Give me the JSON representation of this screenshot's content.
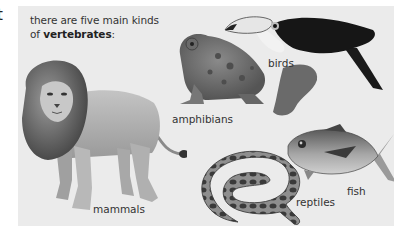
{
  "edge_fragment": "t",
  "intro": {
    "line1": "there are five main kinds",
    "line2_prefix": "of ",
    "line2_bold": "vertebrates",
    "line2_suffix": ":"
  },
  "animals": [
    {
      "name": "lion",
      "label": "mammals"
    },
    {
      "name": "toad",
      "label": "amphibians"
    },
    {
      "name": "toucan",
      "label": "birds"
    },
    {
      "name": "snake",
      "label": "reptiles"
    },
    {
      "name": "tuna",
      "label": "fish"
    }
  ],
  "colors": {
    "panel_bg": "#ebebeb",
    "text": "#333333"
  }
}
